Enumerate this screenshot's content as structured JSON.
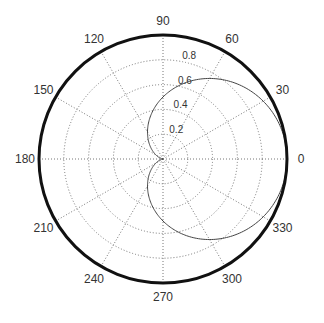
{
  "chart_data": {
    "type": "polar-line",
    "title": "",
    "function": "r = 0.5*(1+cos(theta))",
    "theta_deg": [
      0,
      15,
      30,
      45,
      60,
      75,
      90,
      105,
      120,
      135,
      150,
      165,
      180,
      195,
      210,
      225,
      240,
      255,
      270,
      285,
      300,
      315,
      330,
      345,
      360
    ],
    "r": [
      1.0,
      0.983,
      0.933,
      0.854,
      0.75,
      0.629,
      0.5,
      0.371,
      0.25,
      0.146,
      0.067,
      0.017,
      0.0,
      0.017,
      0.067,
      0.146,
      0.25,
      0.371,
      0.5,
      0.629,
      0.75,
      0.854,
      0.933,
      0.983,
      1.0
    ],
    "angle_ticks": [
      "0",
      "30",
      "60",
      "90",
      "120",
      "150",
      "180",
      "210",
      "240",
      "270",
      "300",
      "330"
    ],
    "radial_ticks": [
      "0.2",
      "0.4",
      "0.6",
      "0.8"
    ],
    "rlim": [
      0,
      1
    ],
    "grid": true
  },
  "style": {
    "line_color": "#444444",
    "grid_color": "#777777",
    "frame_color": "#111111"
  }
}
